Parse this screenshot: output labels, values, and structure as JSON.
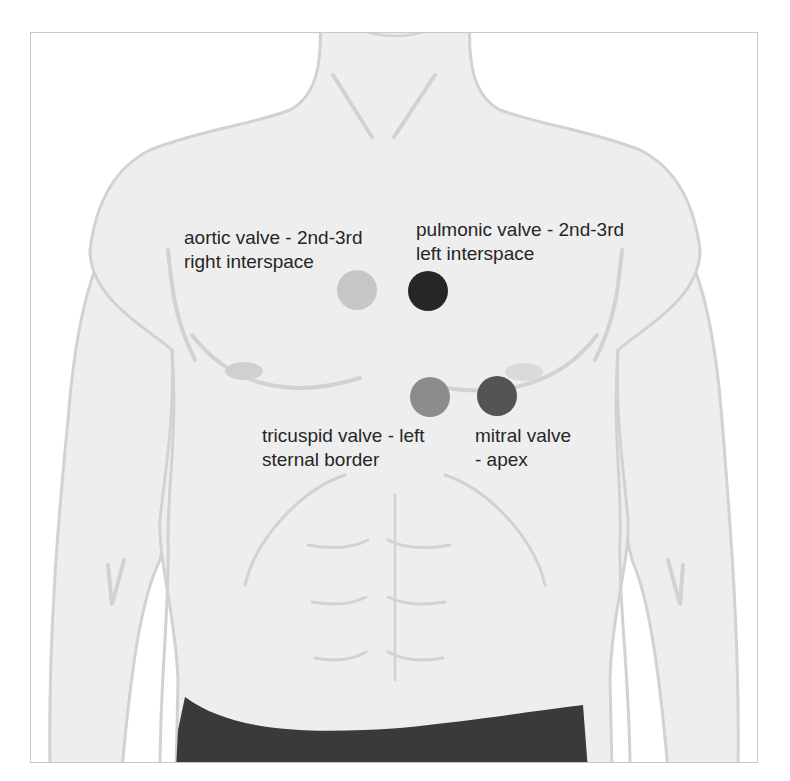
{
  "figure": {
    "colors": {
      "skin": "#eeeeee",
      "outline": "#d2d2d2",
      "nipple": "#d0d0d0",
      "shorts": "#3a3a3a",
      "background": "#ffffff"
    }
  },
  "valves": [
    {
      "id": "aortic",
      "label_line1": "aortic valve - 2nd-3rd",
      "label_line2": "right interspace",
      "color": "#c6c6c6",
      "center": [
        357,
        290
      ],
      "radius": 20
    },
    {
      "id": "pulmonic",
      "label_line1": "pulmonic valve - 2nd-3rd",
      "label_line2": "left interspace",
      "color": "#262626",
      "center": [
        428,
        291
      ],
      "radius": 20
    },
    {
      "id": "tricuspid",
      "label_line1": "tricuspid valve - left",
      "label_line2": "sternal border",
      "color": "#8c8c8c",
      "center": [
        430,
        397
      ],
      "radius": 20
    },
    {
      "id": "mitral",
      "label_line1": "mitral valve",
      "label_line2": "- apex",
      "color": "#545454",
      "center": [
        497,
        396
      ],
      "radius": 20
    }
  ]
}
